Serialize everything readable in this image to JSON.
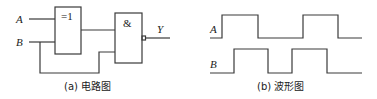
{
  "circuit": {
    "inputs": [
      "A",
      "B"
    ],
    "output": "Y",
    "gates": [
      {
        "type": "XOR",
        "symbol": "=1"
      },
      {
        "type": "NAND",
        "symbol": "&"
      }
    ],
    "caption": "(a) 电路图"
  },
  "waveform": {
    "signals": [
      {
        "name": "A",
        "transitions_x": [
          222,
          258,
          303,
          338
        ]
      },
      {
        "name": "B",
        "transitions_x": [
          234,
          268,
          292,
          327
        ]
      }
    ],
    "caption": "(b) 波形图"
  },
  "colors": {
    "line": "#3a3a3a",
    "text": "#222222",
    "background": "#ffffff"
  }
}
